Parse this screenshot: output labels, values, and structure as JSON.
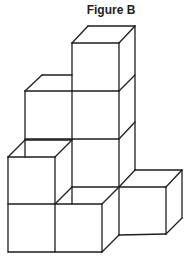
{
  "title": "Figure B",
  "colors": {
    "stroke": "#1e1e1e",
    "background": "#ffffff",
    "title": "#222222"
  },
  "figure": {
    "cube_count": 7,
    "lines": [
      [
        72,
        43,
        119,
        43
      ],
      [
        72,
        43,
        88,
        26
      ],
      [
        88,
        26,
        135,
        26
      ],
      [
        119,
        43,
        135,
        26
      ],
      [
        135,
        26,
        135,
        170
      ],
      [
        72,
        43,
        72,
        204
      ],
      [
        119,
        43,
        119,
        187
      ],
      [
        72,
        91,
        119,
        91
      ],
      [
        119,
        91,
        135,
        75
      ],
      [
        25,
        91,
        72,
        91
      ],
      [
        25,
        91,
        42,
        75
      ],
      [
        42,
        75,
        72,
        75
      ],
      [
        25,
        91,
        25,
        157
      ],
      [
        72,
        139,
        119,
        139
      ],
      [
        119,
        139,
        135,
        122
      ],
      [
        25,
        139,
        72,
        139
      ],
      [
        8,
        157,
        55,
        157
      ],
      [
        8,
        157,
        25,
        140
      ],
      [
        25,
        140,
        72,
        140
      ],
      [
        55,
        157,
        72,
        140
      ],
      [
        8,
        157,
        8,
        252
      ],
      [
        55,
        157,
        55,
        252
      ],
      [
        8,
        204,
        102,
        204
      ],
      [
        8,
        252,
        102,
        252
      ],
      [
        72,
        187,
        119,
        187
      ],
      [
        55,
        204,
        72,
        187
      ],
      [
        102,
        204,
        102,
        252
      ],
      [
        102,
        204,
        119,
        187
      ],
      [
        102,
        252,
        119,
        235
      ],
      [
        119,
        187,
        119,
        235
      ],
      [
        119,
        187,
        166,
        187
      ],
      [
        119,
        187,
        135,
        170
      ],
      [
        135,
        170,
        182,
        170
      ],
      [
        166,
        187,
        182,
        170
      ],
      [
        166,
        187,
        166,
        234
      ],
      [
        182,
        170,
        182,
        218
      ],
      [
        166,
        234,
        182,
        218
      ],
      [
        119,
        235,
        166,
        234
      ]
    ]
  }
}
